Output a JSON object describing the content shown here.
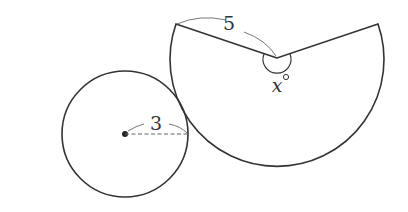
{
  "diagram": {
    "circle": {
      "radius_label": "3",
      "center": [
        125,
        134
      ],
      "r": 63
    },
    "sector": {
      "side_label": "5",
      "angle_label": "x",
      "degree_symbol": "°",
      "vertex": [
        277,
        58
      ],
      "r": 107,
      "left_end": [
        176,
        24
      ],
      "right_end": [
        378,
        24
      ]
    },
    "colors": {
      "stroke": "#333333",
      "annotation": "#777777"
    }
  }
}
